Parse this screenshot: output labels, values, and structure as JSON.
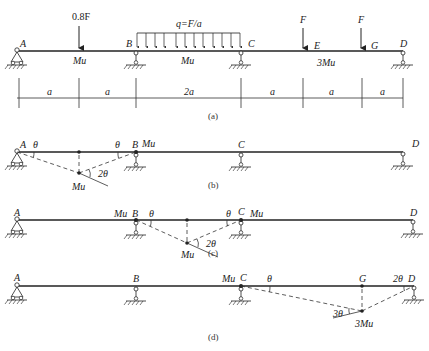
{
  "figures": {
    "a": {
      "caption": "(a)",
      "points": {
        "A": "A",
        "B": "B",
        "C": "C",
        "D": "D",
        "E": "E",
        "G": "G"
      },
      "loads": {
        "point_load_1": "0.8F",
        "distributed": "q=F/a",
        "point_load_E": "F",
        "point_load_G": "F"
      },
      "moment_capacities": {
        "AB": "Mu",
        "BC": "Mu",
        "CD": "3Mu"
      },
      "dimensions": [
        "a",
        "a",
        "2a",
        "a",
        "a",
        "a"
      ]
    },
    "b": {
      "caption": "(b)",
      "points": {
        "A": "A",
        "B": "B",
        "C": "C",
        "D": "D"
      },
      "angles": {
        "at_A": "θ",
        "at_B": "θ",
        "at_hinge": "2θ"
      },
      "hinges": {
        "B": "Mu",
        "mid": "Mu"
      }
    },
    "c": {
      "caption": "(c)",
      "points": {
        "A": "A",
        "B": "B",
        "C": "C",
        "D": "D"
      },
      "angles": {
        "at_B": "θ",
        "at_C": "θ",
        "at_hinge": "2θ"
      },
      "hinges": {
        "B": "Mu",
        "C": "Mu",
        "mid": "Mu"
      }
    },
    "d": {
      "caption": "(d)",
      "points": {
        "A": "A",
        "B": "B",
        "C": "C",
        "G": "G",
        "D": "D"
      },
      "angles": {
        "at_C": "θ",
        "at_D": "2θ",
        "at_hinge": "3θ"
      },
      "hinges": {
        "C": "Mu",
        "G": "3Mu"
      }
    }
  }
}
